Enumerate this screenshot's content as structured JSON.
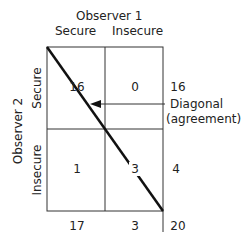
{
  "observer1": {
    "label": "Observer 1",
    "columns": [
      "Secure",
      "Insecure"
    ]
  },
  "observer2": {
    "label": "Observer 2",
    "rows": [
      "Secure",
      "Insecure"
    ]
  },
  "cells": {
    "r0c0": "16",
    "r0c1": "0",
    "r1c0": "1",
    "r1c1": "3"
  },
  "row_totals": [
    "16",
    "4"
  ],
  "col_totals": [
    "17",
    "3"
  ],
  "grand_total": "20",
  "annotation": {
    "line1": "Diagonal",
    "line2": "(agreement)",
    "icon": "arrow-left-icon"
  },
  "colors": {
    "lines": "#333333",
    "diagonal": "#111111",
    "text": "#222222"
  }
}
